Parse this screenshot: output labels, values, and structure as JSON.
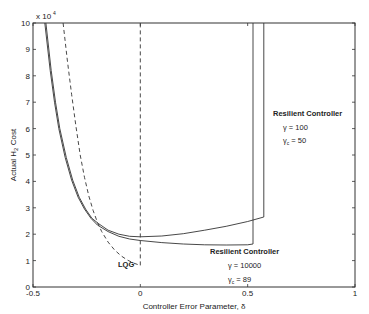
{
  "chart_data": {
    "type": "line",
    "title": "",
    "xlabel": "Controller Error Parameter, δ",
    "ylabel": "Actual H₂ Cost",
    "y_scale_label": "x 10",
    "y_scale_exp": "4",
    "xlim": [
      -0.5,
      1
    ],
    "ylim": [
      0,
      10
    ],
    "x_ticks": [
      -0.5,
      0,
      0.5,
      1
    ],
    "x_tick_labels": [
      "-0.5",
      "0",
      "0.5",
      "1"
    ],
    "y_ticks": [
      0,
      1,
      2,
      3,
      4,
      5,
      6,
      7,
      8,
      9,
      10
    ],
    "y_tick_labels": [
      "0",
      "1",
      "2",
      "3",
      "4",
      "5",
      "6",
      "7",
      "8",
      "9",
      "10"
    ],
    "grid": false,
    "series": [
      {
        "name": "LQG",
        "style": "dashed",
        "x": [
          -0.36,
          -0.34,
          -0.32,
          -0.3,
          -0.28,
          -0.26,
          -0.24,
          -0.22,
          -0.2,
          -0.18,
          -0.15,
          -0.12,
          -0.09,
          -0.06,
          -0.03,
          0.0
        ],
        "y": [
          10,
          8.6,
          7.3,
          6.1,
          5.0,
          4.15,
          3.45,
          2.9,
          2.45,
          2.1,
          1.7,
          1.4,
          1.18,
          1.02,
          0.9,
          0.82
        ]
      },
      {
        "name": "Resilient Controller γ=10000, γc=89",
        "style": "solid",
        "x": [
          -0.445,
          -0.42,
          -0.4,
          -0.38,
          -0.35,
          -0.32,
          -0.29,
          -0.26,
          -0.23,
          -0.2,
          -0.15,
          -0.1,
          -0.05,
          0.0,
          0.1,
          0.2,
          0.3,
          0.4,
          0.5,
          0.525,
          0.525
        ],
        "y": [
          10,
          8.2,
          7.0,
          6.0,
          4.9,
          4.05,
          3.4,
          2.95,
          2.6,
          2.35,
          2.1,
          1.92,
          1.82,
          1.76,
          1.68,
          1.63,
          1.6,
          1.59,
          1.6,
          1.63,
          10
        ]
      },
      {
        "name": "Resilient Controller γ=100, γc=50",
        "style": "solid",
        "x": [
          -0.44,
          -0.415,
          -0.395,
          -0.375,
          -0.345,
          -0.315,
          -0.285,
          -0.255,
          -0.225,
          -0.195,
          -0.15,
          -0.1,
          -0.05,
          0.0,
          0.1,
          0.2,
          0.3,
          0.4,
          0.5,
          0.575,
          0.575
        ],
        "y": [
          10,
          8.2,
          7.0,
          6.0,
          4.9,
          4.05,
          3.4,
          2.95,
          2.6,
          2.4,
          2.15,
          2.0,
          1.92,
          1.9,
          1.93,
          2.02,
          2.15,
          2.3,
          2.48,
          2.65,
          10
        ]
      },
      {
        "name": "δ=0 reference",
        "style": "dashed",
        "x": [
          0,
          0
        ],
        "y": [
          0.82,
          10
        ]
      }
    ],
    "annotations": [
      {
        "text": "LQG",
        "x": -0.1,
        "y": 0.9
      },
      {
        "lines": [
          "Resilient Controller",
          "γ = 10000",
          "γc = 89"
        ],
        "x": 0.34,
        "y": 1.4
      },
      {
        "lines": [
          "Resilient Controller",
          "γ = 100",
          "γc = 50"
        ],
        "x": 0.72,
        "y": 5.4
      }
    ]
  }
}
